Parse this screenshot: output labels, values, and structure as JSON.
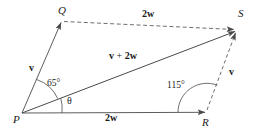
{
  "figure": {
    "stroke_color": "#4a4a4a",
    "text_color": "#1a1a1a",
    "background": "#ffffff",
    "vertices": [
      {
        "id": "P",
        "label": "P",
        "x": 22,
        "y": 113
      },
      {
        "id": "Q",
        "label": "Q",
        "x": 62,
        "y": 21
      },
      {
        "id": "R",
        "label": "R",
        "x": 207,
        "y": 112
      },
      {
        "id": "S",
        "label": "S",
        "x": 237,
        "y": 30
      }
    ],
    "edges": [
      {
        "id": "PQ",
        "from": "P",
        "to": "Q",
        "style": "solid",
        "arrow": true,
        "label": "v"
      },
      {
        "id": "PR",
        "from": "P",
        "to": "R",
        "style": "solid",
        "arrow": true,
        "label": "2w"
      },
      {
        "id": "PS",
        "from": "P",
        "to": "S",
        "style": "solid",
        "arrow": true,
        "label": "v + 2w"
      },
      {
        "id": "QS",
        "from": "Q",
        "to": "S",
        "style": "dashed",
        "arrow": true,
        "label": "2w"
      },
      {
        "id": "RS",
        "from": "R",
        "to": "S",
        "style": "dashed",
        "arrow": true,
        "label": "v"
      }
    ],
    "labels": {
      "v_left": "v",
      "v_right": "v",
      "two_w_top": "2w",
      "two_w_bottom": "2w",
      "resultant_v": "v",
      "resultant_plus": "+",
      "resultant_2w": "2w",
      "resultant_full": "v + 2w"
    },
    "angles": [
      {
        "id": "angle-QPS",
        "label": "65°",
        "value": 65,
        "unit": "degrees",
        "at": "P",
        "between": [
          "PQ",
          "PS"
        ]
      },
      {
        "id": "angle-SPR",
        "label": "θ",
        "value": null,
        "unit": "degrees",
        "at": "P",
        "between": [
          "PS",
          "PR"
        ]
      },
      {
        "id": "angle-PRS",
        "label": "115°",
        "value": 115,
        "unit": "degrees",
        "at": "R",
        "between": [
          "RP",
          "RS"
        ]
      }
    ]
  }
}
